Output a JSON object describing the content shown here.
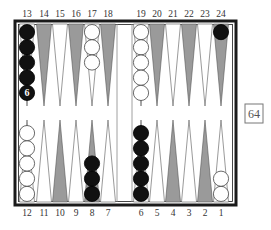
{
  "board": {
    "top_labels": [
      "13",
      "14",
      "15",
      "16",
      "17",
      "18",
      "19",
      "20",
      "21",
      "22",
      "23",
      "24"
    ],
    "bottom_labels": [
      "12",
      "11",
      "10",
      "9",
      "8",
      "7",
      "6",
      "5",
      "4",
      "3",
      "2",
      "1"
    ],
    "colors": {
      "frame": "#1a1a1a",
      "point_dark": "#9a9a9a",
      "point_light": "#ffffff",
      "checker_black": "#111111",
      "checker_white": "#ffffff"
    }
  },
  "points": [
    {
      "point": 13,
      "color": "black",
      "count": 6,
      "shown": 5,
      "label": "6"
    },
    {
      "point": 17,
      "color": "white",
      "count": 3
    },
    {
      "point": 19,
      "color": "white",
      "count": 5
    },
    {
      "point": 24,
      "color": "black",
      "count": 1
    },
    {
      "point": 12,
      "color": "white",
      "count": 5
    },
    {
      "point": 8,
      "color": "black",
      "count": 3
    },
    {
      "point": 6,
      "color": "black",
      "count": 5
    },
    {
      "point": 1,
      "color": "white",
      "count": 2
    }
  ],
  "cube": {
    "value": "64"
  }
}
